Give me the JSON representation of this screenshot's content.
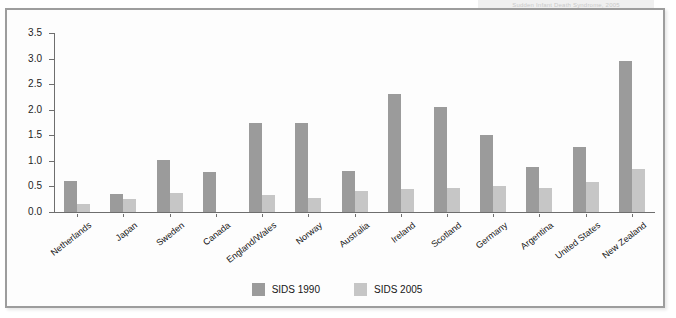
{
  "top_caption": "Sudden Infant Death Syndrome, 2005",
  "legend": {
    "position": "bottom-center",
    "entries": [
      {
        "label": "SIDS 1990",
        "color": "#9b9b9b"
      },
      {
        "label": "SIDS 2005",
        "color": "#c6c6c6"
      }
    ]
  },
  "axis": {
    "y_ticks": [
      "0.0",
      "0.5",
      "1.0",
      "1.5",
      "2.0",
      "2.5",
      "3.0",
      "3.5"
    ],
    "y_min": 0.0,
    "y_max": 3.5
  },
  "chart_data": {
    "type": "bar",
    "title": "",
    "xlabel": "",
    "ylabel": "",
    "ylim": [
      0,
      3.5
    ],
    "grid": false,
    "legend_position": "bottom-center",
    "categories": [
      "Netherlands",
      "Japan",
      "Sweden",
      "Canada",
      "England/Wales",
      "Norway",
      "Australia",
      "Ireland",
      "Scotland",
      "Germany",
      "Argentina",
      "United States",
      "New Zealand"
    ],
    "series": [
      {
        "name": "SIDS 1990",
        "color": "#9b9b9b",
        "values": [
          0.6,
          0.35,
          1.02,
          0.78,
          1.75,
          1.75,
          0.8,
          2.3,
          2.05,
          1.5,
          0.88,
          1.28,
          2.95
        ]
      },
      {
        "name": "SIDS 2005",
        "color": "#c6c6c6",
        "values": [
          0.15,
          0.25,
          0.38,
          0.0,
          0.33,
          0.28,
          0.42,
          0.45,
          0.47,
          0.5,
          0.47,
          0.58,
          0.85
        ]
      }
    ],
    "yticks": [
      0.0,
      0.5,
      1.0,
      1.5,
      2.0,
      2.5,
      3.0,
      3.5
    ]
  }
}
